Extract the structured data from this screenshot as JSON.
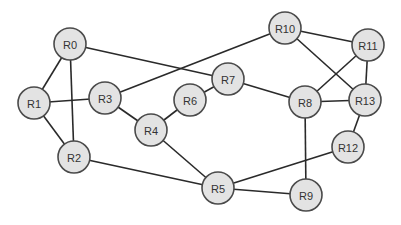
{
  "diagram": {
    "title": "",
    "node_radius": 16,
    "colors": {
      "node_fill": "#e3e3e3",
      "node_stroke": "#4a4a4a",
      "edge": "#2a2a2a",
      "label": "#333333",
      "background": "#ffffff"
    },
    "nodes": [
      {
        "id": "R0",
        "label": "R0",
        "x": 70,
        "y": 44
      },
      {
        "id": "R1",
        "label": "R1",
        "x": 34,
        "y": 103
      },
      {
        "id": "R2",
        "label": "R2",
        "x": 74,
        "y": 157
      },
      {
        "id": "R3",
        "label": "R3",
        "x": 105,
        "y": 98
      },
      {
        "id": "R4",
        "label": "R4",
        "x": 151,
        "y": 130
      },
      {
        "id": "R5",
        "label": "R5",
        "x": 218,
        "y": 188
      },
      {
        "id": "R6",
        "label": "R6",
        "x": 190,
        "y": 100
      },
      {
        "id": "R7",
        "label": "R7",
        "x": 228,
        "y": 79
      },
      {
        "id": "R8",
        "label": "R8",
        "x": 305,
        "y": 102
      },
      {
        "id": "R9",
        "label": "R9",
        "x": 306,
        "y": 195
      },
      {
        "id": "R10",
        "label": "R10",
        "x": 285,
        "y": 28
      },
      {
        "id": "R11",
        "label": "R11",
        "x": 368,
        "y": 45
      },
      {
        "id": "R12",
        "label": "R12",
        "x": 348,
        "y": 147
      },
      {
        "id": "R13",
        "label": "R13",
        "x": 365,
        "y": 100
      }
    ],
    "edges": [
      [
        "R0",
        "R1"
      ],
      [
        "R0",
        "R2"
      ],
      [
        "R0",
        "R7"
      ],
      [
        "R1",
        "R3"
      ],
      [
        "R1",
        "R2"
      ],
      [
        "R3",
        "R10"
      ],
      [
        "R3",
        "R4"
      ],
      [
        "R4",
        "R6"
      ],
      [
        "R4",
        "R5"
      ],
      [
        "R6",
        "R7"
      ],
      [
        "R7",
        "R8"
      ],
      [
        "R10",
        "R11"
      ],
      [
        "R10",
        "R13"
      ],
      [
        "R11",
        "R8"
      ],
      [
        "R11",
        "R13"
      ],
      [
        "R8",
        "R13"
      ],
      [
        "R8",
        "R9"
      ],
      [
        "R13",
        "R12"
      ],
      [
        "R12",
        "R5"
      ],
      [
        "R5",
        "R9"
      ],
      [
        "R2",
        "R5"
      ]
    ]
  }
}
